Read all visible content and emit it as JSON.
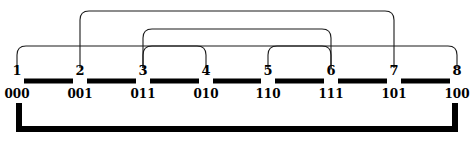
{
  "diagram": {
    "type": "gray-code-arc-diagram",
    "width": 476,
    "height": 142,
    "stroke_color": "#1a1a1a",
    "thick_color": "#000000",
    "background_color": "#ffffff",
    "nodes": [
      {
        "index": "1",
        "code": "000",
        "x": 17
      },
      {
        "index": "2",
        "code": "001",
        "x": 80
      },
      {
        "index": "3",
        "code": "011",
        "x": 143
      },
      {
        "index": "4",
        "code": "010",
        "x": 206
      },
      {
        "index": "5",
        "code": "110",
        "x": 268
      },
      {
        "index": "6",
        "code": "111",
        "x": 331
      },
      {
        "index": "7",
        "code": "101",
        "x": 394
      },
      {
        "index": "8",
        "code": "100",
        "x": 457
      }
    ],
    "arcs": [
      {
        "name": "arc-2-7",
        "from": 2,
        "to": 7,
        "from_x": 80,
        "to_x": 394,
        "top_y": 11,
        "base_y": 68,
        "radius": 9
      },
      {
        "name": "arc-3-6",
        "from": 3,
        "to": 6,
        "from_x": 143,
        "to_x": 331,
        "top_y": 29,
        "base_y": 68,
        "radius": 9
      },
      {
        "name": "arc-1-8",
        "from": 1,
        "to": 8,
        "from_x": 17,
        "to_x": 457,
        "top_y": 46,
        "base_y": 68,
        "radius": 9
      },
      {
        "name": "arc-3-4",
        "from": 3,
        "to": 4,
        "from_x": 143,
        "to_x": 206,
        "top_y": 46,
        "base_y": 68,
        "radius": 9
      },
      {
        "name": "arc-5-6",
        "from": 5,
        "to": 6,
        "from_x": 268,
        "to_x": 331,
        "top_y": 46,
        "base_y": 68,
        "radius": 9
      }
    ],
    "spine": {
      "name": "spine-segments",
      "y": 81,
      "thickness": 5,
      "segments": [
        {
          "x1": 24,
          "x2": 73
        },
        {
          "x1": 87,
          "x2": 136
        },
        {
          "x1": 150,
          "x2": 199
        },
        {
          "x1": 213,
          "x2": 261
        },
        {
          "x1": 275,
          "x2": 324
        },
        {
          "x1": 338,
          "x2": 387
        },
        {
          "x1": 401,
          "x2": 450
        }
      ]
    },
    "bottom_bracket": {
      "name": "bottom-bracket",
      "left_x": 19,
      "right_x": 455,
      "top_y": 103,
      "bottom_y": 129,
      "thickness": 6
    },
    "labels": {
      "index_label_y": 64,
      "code_label_y": 88
    }
  }
}
